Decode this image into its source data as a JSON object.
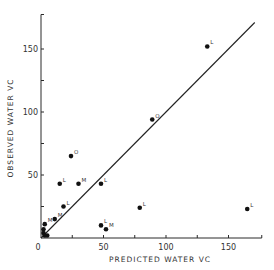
{
  "chart_data": {
    "type": "scatter",
    "title": "",
    "xlabel": "PREDICTED WATER VC",
    "ylabel": "OBSERVED WATER VC",
    "xlim": [
      0,
      175
    ],
    "ylim": [
      0,
      175
    ],
    "x_ticks": [
      0,
      50,
      100,
      150
    ],
    "x_minor_ticks": [
      25,
      75,
      125,
      175
    ],
    "y_ticks": [
      50,
      100,
      150
    ],
    "y_minor_ticks": [
      25,
      75,
      125,
      175
    ],
    "origin_label": "0",
    "grid": false,
    "reference_line": {
      "label": "1:1 line",
      "from": [
        0,
        0
      ],
      "to": [
        175,
        175
      ]
    },
    "points": [
      {
        "x": 133,
        "y": 152,
        "label": "L"
      },
      {
        "x": 89,
        "y": 94,
        "label": "O"
      },
      {
        "x": 24,
        "y": 65,
        "label": "O"
      },
      {
        "x": 15,
        "y": 43,
        "label": "L"
      },
      {
        "x": 30,
        "y": 43,
        "label": "M"
      },
      {
        "x": 48,
        "y": 43,
        "label": "L"
      },
      {
        "x": 79,
        "y": 24,
        "label": "L"
      },
      {
        "x": 165,
        "y": 23,
        "label": "L"
      },
      {
        "x": 48,
        "y": 10,
        "label": "L"
      },
      {
        "x": 52,
        "y": 7,
        "label": "M"
      },
      {
        "x": 18,
        "y": 25,
        "label": "L"
      },
      {
        "x": 11,
        "y": 15,
        "label": "M"
      },
      {
        "x": 3,
        "y": 11,
        "label": "M"
      },
      {
        "x": 2,
        "y": 7,
        "label": ""
      },
      {
        "x": 2,
        "y": 4,
        "label": ""
      },
      {
        "x": 3,
        "y": 2,
        "label": ""
      },
      {
        "x": 5,
        "y": 2,
        "label": ""
      }
    ]
  },
  "plot": {
    "origin_px": [
      41,
      238
    ],
    "px_per_unit_x": 1.25,
    "px_per_unit_y": 1.26
  }
}
